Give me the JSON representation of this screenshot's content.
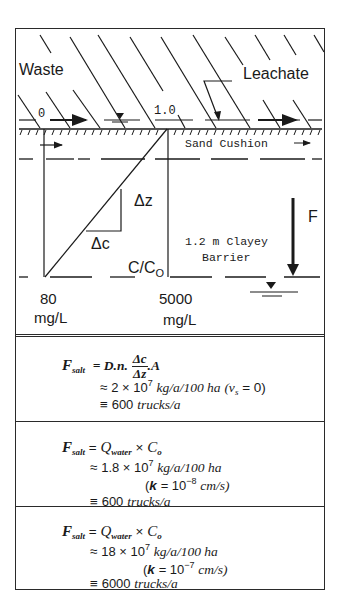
{
  "diagram": {
    "labels": {
      "waste": "Waste",
      "leachate": "Leachate",
      "c_over_c0_start": "0",
      "c_over_c0_end": "1.0",
      "sand_cushion": "Sand Cushion",
      "delta_z": "Δz",
      "delta_c": "Δc",
      "barrier": "1.2 m Clayey",
      "barrier_line2": "Barrier",
      "c_over_c0_axis": "C/C",
      "c_over_c0_axis_sub": "O",
      "flux": "F",
      "left_conc_value": "80",
      "left_conc_unit": "mg/L",
      "right_conc_value": "5000",
      "right_conc_unit": "mg/L"
    },
    "icons": {
      "water_table": "water-table-triangle-icon",
      "flow_arrow": "right-arrow-icon",
      "flux_arrow": "down-arrow-icon"
    },
    "colors": {
      "ink": "#1a1a1a",
      "background": "#ffffff"
    }
  },
  "equations": [
    {
      "lhs": "F",
      "lhs_sub": "salt",
      "rhs_formula": {
        "prefix": "= D.n.",
        "frac_num": "Δc",
        "frac_den": "Δz",
        "suffix": ".A"
      },
      "line2": {
        "approx": "≈",
        "mantissa": "2 × 10",
        "exp": "7",
        "unit": "kg/a/100 ha",
        "cond": "(v",
        "cond_sub": "s",
        "cond_tail": " = 0)"
      },
      "line3": {
        "equiv": "≡",
        "value": "600",
        "unit": "trucks/a"
      }
    },
    {
      "lhs": "F",
      "lhs_sub": "salt",
      "rhs": {
        "eq": "=",
        "q": "Q",
        "q_sub": "water",
        "times": "×",
        "c": "C",
        "c_sub": "o"
      },
      "line2": {
        "approx": "≈",
        "mantissa": "1.8 × 10",
        "exp": "7",
        "unit": "kg/a/100 ha"
      },
      "line3": {
        "open": "(",
        "k": "k",
        "eq": "= 10",
        "exp": "−8",
        "unit": "cm/s)"
      },
      "line4": {
        "equiv": "≡",
        "value": "600",
        "unit": "trucks/a"
      }
    },
    {
      "lhs": "F",
      "lhs_sub": "salt",
      "rhs": {
        "eq": "=",
        "q": "Q",
        "q_sub": "water",
        "times": "×",
        "c": "C",
        "c_sub": "o"
      },
      "line2": {
        "approx": "≈",
        "mantissa": "18 × 10",
        "exp": "7",
        "unit": "kg/a/100 ha"
      },
      "line3": {
        "open": "(",
        "k": "k",
        "eq": "= 10",
        "exp": "−7",
        "unit": "cm/s)"
      },
      "line4": {
        "equiv": "≡",
        "value": "6000",
        "unit": "trucks/a"
      }
    }
  ]
}
